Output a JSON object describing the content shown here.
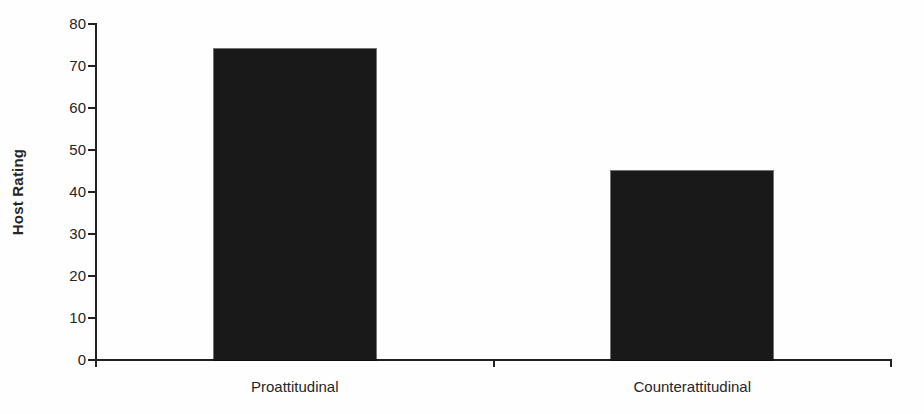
{
  "chart_data": {
    "type": "bar",
    "categories": [
      "Proattitudinal",
      "Counterattitudinal"
    ],
    "values": [
      74,
      45
    ],
    "title": "",
    "xlabel": "",
    "ylabel": "Host Rating",
    "ylim": [
      0,
      80
    ],
    "yticks": [
      0,
      10,
      20,
      30,
      40,
      50,
      60,
      70,
      80
    ],
    "grid": false,
    "legend": null,
    "bar_color": "#191919",
    "axis_color": "#212121",
    "text_color": "#262626",
    "background_color": "#fefefe"
  }
}
